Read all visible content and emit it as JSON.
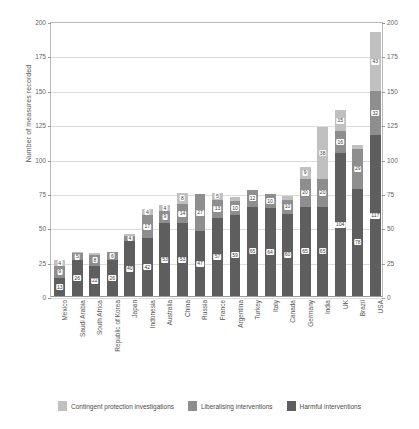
{
  "chart_data": {
    "type": "bar",
    "stacked": true,
    "title": "",
    "xlabel": "",
    "ylabel": "Number of measures recorded",
    "ylim": [
      0,
      200
    ],
    "yticks": [
      0,
      25,
      50,
      75,
      100,
      125,
      150,
      175,
      200
    ],
    "right_axis": true,
    "right_yticks": [
      0,
      25,
      50,
      75,
      100,
      125,
      150,
      175,
      200
    ],
    "grid": true,
    "legend_position": "bottom",
    "categories": [
      "Mexico",
      "Saudi Arabia",
      "South Africa",
      "Republic of Korea",
      "Japan",
      "Indonesia",
      "Australia",
      "China",
      "Russia",
      "France",
      "Argentina",
      "Turkey",
      "Italy",
      "Canada",
      "Germany",
      "India",
      "UK",
      "Brazil",
      "USA"
    ],
    "series": [
      {
        "name": "Harmful interventions",
        "color": "#5e5e5e",
        "values": [
          13,
          26,
          22,
          26,
          40,
          42,
          53,
          53,
          47,
          57,
          59,
          65,
          64,
          60,
          65,
          65,
          104,
          78,
          117
        ]
      },
      {
        "name": "Liberalising interventions",
        "color": "#8e8e8e",
        "values": [
          9,
          5,
          8,
          6,
          4,
          17,
          9,
          14,
          27,
          13,
          10,
          12,
          10,
          10,
          20,
          20,
          16,
          29,
          32
        ]
      },
      {
        "name": "Contingent protection investigations",
        "color": "#c0c0c0",
        "values": [
          4,
          1,
          1,
          0,
          1,
          4,
          4,
          8,
          0,
          5,
          3,
          0,
          0,
          3,
          9,
          38,
          15,
          3,
          43
        ]
      }
    ],
    "legend": [
      {
        "label": "Contingent protection investigations",
        "color": "#c0c0c0",
        "key": "contingent"
      },
      {
        "label": "Liberalising interventions",
        "color": "#8e8e8e",
        "key": "liberalising"
      },
      {
        "label": "Harmful interventions",
        "color": "#5e5e5e",
        "key": "harmful"
      }
    ]
  }
}
